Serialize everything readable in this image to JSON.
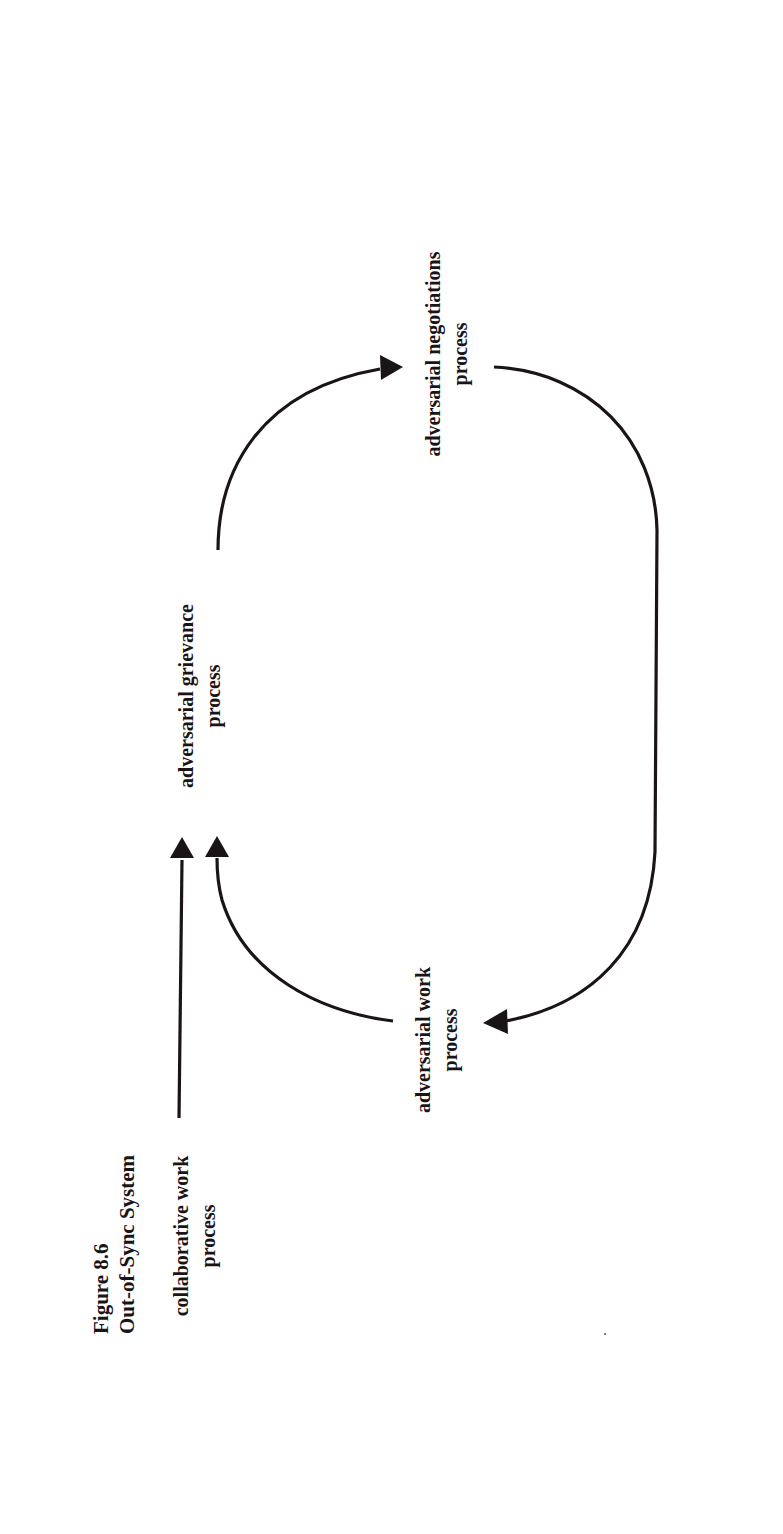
{
  "figure": {
    "number": "Figure 8.6",
    "title": "Out-of-Sync System",
    "orientation": "rotated 90° counter-clockwise (text reads bottom-to-top)"
  },
  "nodes": [
    {
      "id": "collaborative_work",
      "line1": "collaborative work",
      "line2": "process"
    },
    {
      "id": "adversarial_work",
      "line1": "adversarial work",
      "line2": "process"
    },
    {
      "id": "adversarial_grievance",
      "line1": "adversarial grievance",
      "line2": "process"
    },
    {
      "id": "adversarial_negotiations",
      "line1": "adversarial negotiations",
      "line2": "process"
    }
  ],
  "edges": [
    {
      "from": "collaborative_work",
      "to": "adversarial_grievance",
      "shape": "straight"
    },
    {
      "from": "adversarial_work",
      "to": "adversarial_grievance",
      "shape": "curved"
    },
    {
      "from": "adversarial_grievance",
      "to": "adversarial_negotiations",
      "shape": "curved"
    },
    {
      "from": "adversarial_negotiations",
      "to": "adversarial_work",
      "shape": "long-arc"
    }
  ],
  "colors": {
    "ink": "#1a1416",
    "background": "#ffffff"
  }
}
